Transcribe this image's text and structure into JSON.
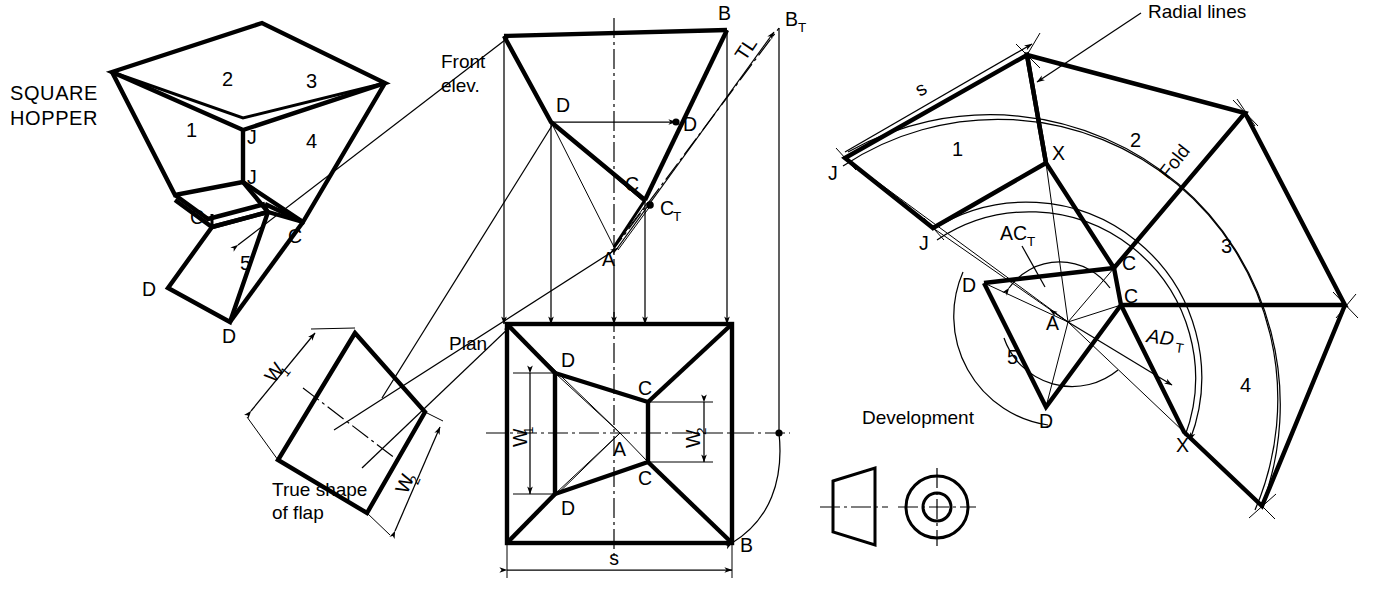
{
  "figure": {
    "stroke_color": "#000000",
    "background_color": "#ffffff"
  },
  "pictorial": {
    "caption_line1": "SQUARE",
    "caption_line2": "HOPPER",
    "panel_labels": [
      "1",
      "2",
      "3",
      "4",
      "5"
    ],
    "vertex_labels": {
      "joint_top": "J",
      "joint_bottom": "J",
      "corner_left": "C",
      "corner_right": "C",
      "flap_left": "D",
      "flap_bottom": "D"
    }
  },
  "flap": {
    "caption_line1": "True shape",
    "caption_line2": "of flap",
    "dim_w1": "W",
    "dim_w1_sub": "1",
    "dim_w2": "W",
    "dim_w2_sub": "2"
  },
  "front_elevation": {
    "caption_line1": "Front",
    "caption_line2": "elev.",
    "labels": {
      "b": "B",
      "b_true": "B",
      "b_true_sub": "T",
      "true_length": "TL",
      "d_left": "D",
      "d_right": "D",
      "c": "C",
      "c_true": "C",
      "c_true_sub": "T",
      "a": "A"
    }
  },
  "plan": {
    "caption": "Plan",
    "labels": {
      "d_top": "D",
      "d_bottom": "D",
      "c_top": "C",
      "c_bottom": "C",
      "a": "A",
      "b": "B"
    },
    "dim_w1": "W",
    "dim_w1_sub": "1",
    "dim_w2": "W",
    "dim_w2_sub": "2",
    "dim_s": "s"
  },
  "development": {
    "caption": "Development",
    "panel_labels": [
      "1",
      "2",
      "3",
      "4",
      "5"
    ],
    "annotations": {
      "radial_lines": "Radial lines",
      "fold": "Fold",
      "dim_s": "s",
      "ac_true": "AC",
      "ac_true_sub": "T",
      "ad_true": "AD",
      "ad_true_sub": "T"
    },
    "vertex_labels": {
      "j_outer": "J",
      "j_inner": "J",
      "x_top": "X",
      "x_bottom": "X",
      "c_upper": "C",
      "c_lower": "C",
      "d_left": "D",
      "d_bottom": "D",
      "a": "A"
    }
  },
  "symbol": {
    "name": "frustum-and-end-view-symbol",
    "description": "cone frustum side view with circular end view"
  }
}
